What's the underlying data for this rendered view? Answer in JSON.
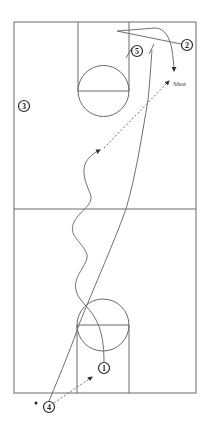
{
  "diagram": {
    "colors": {
      "court_line": "#6a6a6a",
      "player": "#2b2b2b",
      "background": "#ffffff"
    },
    "players": [
      {
        "id": "1",
        "label": "1"
      },
      {
        "id": "2",
        "label": "2"
      },
      {
        "id": "3",
        "label": "3"
      },
      {
        "id": "4",
        "label": "4"
      },
      {
        "id": "5",
        "label": "5"
      }
    ],
    "annotations": {
      "shot_label": "Shot"
    },
    "legend": {
      "solid_line": "player cut",
      "dashed_line": "pass",
      "wavy_line": "dribble",
      "short_bar": "screen"
    }
  }
}
